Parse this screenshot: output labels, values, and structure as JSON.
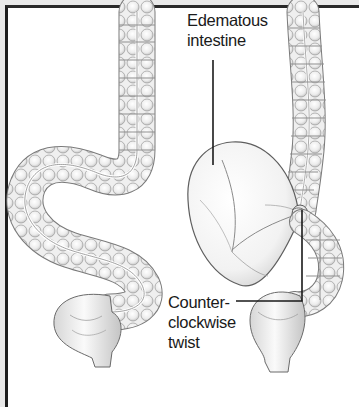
{
  "figure": {
    "panels": [
      {
        "id": "normal",
        "description": "Normal sigmoid colon"
      },
      {
        "id": "volvulus",
        "description": "Sigmoid volvulus with edematous loop"
      }
    ],
    "labels": {
      "edematous": {
        "line1": "Edematous",
        "line2": "intestine"
      },
      "twist": {
        "line1": "Counter-",
        "line2": "clockwise",
        "line3": "twist"
      }
    },
    "colors": {
      "frame": "#1e1e1e",
      "margin": "#e9e9e9",
      "background": "#ffffff",
      "tissue_fill": "#f4f4f4",
      "tissue_shade": "#c8c8c8",
      "outline": "#6a6a6a",
      "leader_line": "#1a1a1a"
    }
  }
}
